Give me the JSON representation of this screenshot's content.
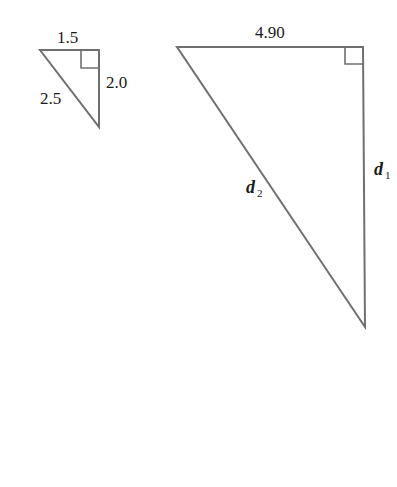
{
  "diagram": {
    "small_triangle": {
      "top_label": "1.5",
      "right_label": "2.0",
      "hypotenuse_label": "2.5"
    },
    "large_triangle": {
      "top_label": "4.90",
      "right_label_var": "d",
      "right_label_sub": "1",
      "hypotenuse_label_var": "d",
      "hypotenuse_label_sub": "2"
    },
    "colors": {
      "line": "#707070",
      "text": "#1a1a1a"
    }
  }
}
